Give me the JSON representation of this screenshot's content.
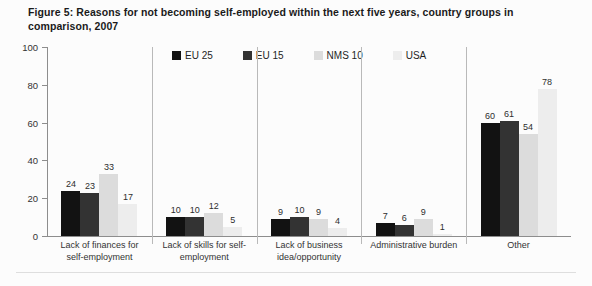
{
  "title": "Figure 5: Reasons for not becoming self-employed within the next five years, country groups in comparison, 2007",
  "chart_data": {
    "type": "bar",
    "title": "Figure 5: Reasons for not becoming self-employed within the next five years, country groups in comparison, 2007",
    "xlabel": "",
    "ylabel": "",
    "ylim": [
      0,
      100
    ],
    "yticks": [
      0,
      20,
      40,
      60,
      80,
      100
    ],
    "grid": false,
    "legend_position": "top-center",
    "value_labels": true,
    "categories": [
      "Lack of finances for self-employment",
      "Lack of skills for self-employment",
      "Lack of business idea/opportunity",
      "Administrative burden",
      "Other"
    ],
    "category_lines": [
      [
        "Lack of finances for",
        "self-employment"
      ],
      [
        "Lack of skills for self-",
        "employment"
      ],
      [
        "Lack of business",
        "idea/opportunity"
      ],
      [
        "Administrative burden",
        ""
      ],
      [
        "Other",
        ""
      ]
    ],
    "series": [
      {
        "name": "EU 25",
        "color": "#121212",
        "values": [
          24,
          10,
          9,
          7,
          60
        ]
      },
      {
        "name": "EU 15",
        "color": "#333333",
        "values": [
          23,
          10,
          10,
          6,
          61
        ]
      },
      {
        "name": "NMS 10",
        "color": "#dcdcdc",
        "values": [
          33,
          12,
          9,
          9,
          54
        ]
      },
      {
        "name": "USA",
        "color": "#ededed",
        "values": [
          17,
          5,
          4,
          1,
          78
        ]
      }
    ]
  }
}
